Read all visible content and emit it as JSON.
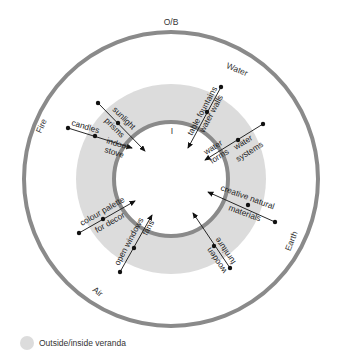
{
  "diagram": {
    "center": [
      171,
      179
    ],
    "outer_ring": {
      "r": 147,
      "stroke": "#8a8a8a",
      "width": 4
    },
    "veranda_disk": {
      "r": 95,
      "fill": "#dcdcdc"
    },
    "inner_ring": {
      "r": 57,
      "stroke": "#8a8a8a",
      "width": 4,
      "fill": "#ffffff"
    },
    "top_label": "O/B",
    "inner_label": "I",
    "elements": [
      {
        "name": "Water",
        "text": "Water"
      },
      {
        "name": "Fire",
        "text": "Fire"
      },
      {
        "name": "Earth",
        "text": "Earth"
      },
      {
        "name": "Air",
        "text": "Air"
      }
    ],
    "items": [
      {
        "id": "sunlight",
        "line1": "sunlight",
        "line2": "prisms"
      },
      {
        "id": "candles",
        "line1": "candles",
        "line2": "indoor",
        "line3": "stove"
      },
      {
        "id": "fountains",
        "line1": "table fountains",
        "line2": "water walls"
      },
      {
        "id": "waterforms",
        "line1": "water",
        "line2": "forms",
        "line3": "water",
        "line4": "systems"
      },
      {
        "id": "materials",
        "line1": "creative natural",
        "line2": "materials"
      },
      {
        "id": "furniture",
        "line1": "wooden",
        "line2": "furniture"
      },
      {
        "id": "palette",
        "line1": "colour palette",
        "line2": "for decor"
      },
      {
        "id": "windows",
        "line1": "open windows",
        "line2": "fans"
      }
    ]
  },
  "legend": {
    "label": "Outside/inside veranda",
    "color": "#dcdcdc"
  }
}
